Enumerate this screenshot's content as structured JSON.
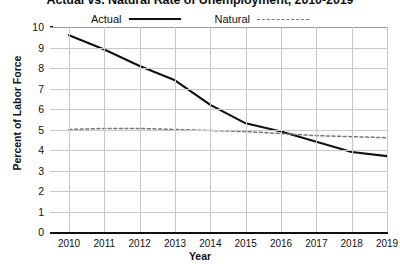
{
  "chart_data": {
    "type": "line",
    "title": "Actual vs. Natural Rate of Unemployment, 2010-2019",
    "xlabel": "Year",
    "ylabel": "Percent of Labor Force",
    "x": [
      2010,
      2011,
      2012,
      2013,
      2014,
      2015,
      2016,
      2017,
      2018,
      2019
    ],
    "categories": [
      "2010",
      "2011",
      "2012",
      "2013",
      "2014",
      "2015",
      "2016",
      "2017",
      "2018",
      "2019"
    ],
    "series": [
      {
        "name": "Actual",
        "style": "solid",
        "color": "#111111",
        "values": [
          9.6,
          8.9,
          8.1,
          7.4,
          6.2,
          5.3,
          4.9,
          4.4,
          3.9,
          3.7
        ]
      },
      {
        "name": "Natural",
        "style": "dashed",
        "color": "#777777",
        "values": [
          5.0,
          5.05,
          5.05,
          5.0,
          4.95,
          4.9,
          4.8,
          4.7,
          4.65,
          4.6
        ]
      }
    ],
    "ylim": [
      0,
      10
    ],
    "yticks": [
      "0",
      "1",
      "2",
      "3",
      "4",
      "5",
      "6",
      "7",
      "8",
      "9",
      "10"
    ],
    "xlim": [
      2010,
      2019
    ],
    "grid": true,
    "legend_position": "top-center"
  },
  "legend": {
    "items": [
      {
        "label": "Actual",
        "style": "solid"
      },
      {
        "label": "Natural",
        "style": "dashed"
      }
    ]
  }
}
